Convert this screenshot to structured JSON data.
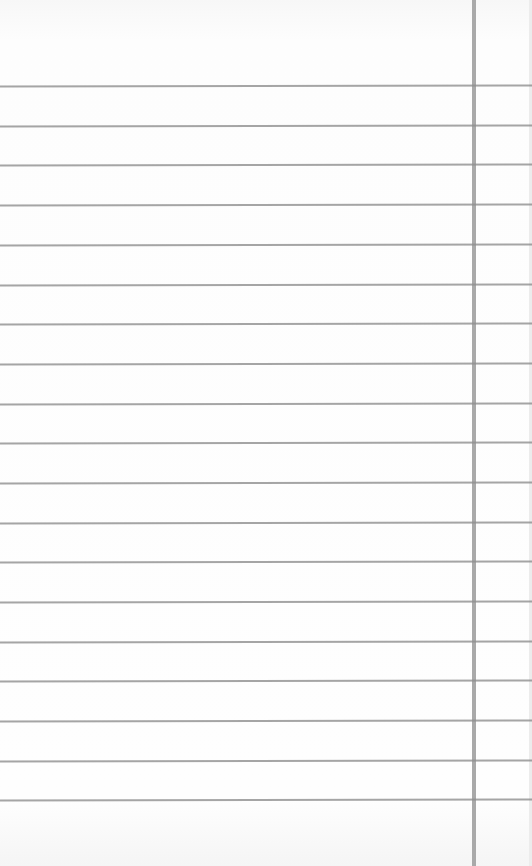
{
  "paper": {
    "type": "lined-notebook-paper",
    "line_color": "#8f8f8f",
    "margin_line_color": "#a9a9a9",
    "background_color": "#fdfdfd",
    "margin_x": 472,
    "lines_y": [
      85,
      125,
      164,
      204,
      244,
      284,
      323,
      363,
      403,
      442,
      482,
      522,
      561,
      601,
      641,
      680,
      720,
      760,
      799
    ]
  }
}
